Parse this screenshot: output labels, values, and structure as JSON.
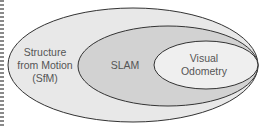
{
  "diagram": {
    "type": "nested-sets",
    "sets": [
      {
        "id": "sfm",
        "lines": [
          "Structure",
          "from Motion",
          "(SfM)"
        ],
        "fill": "#e8e8e8"
      },
      {
        "id": "slam",
        "lines": [
          "SLAM"
        ],
        "fill": "#d0d0d0"
      },
      {
        "id": "vo",
        "lines": [
          "Visual",
          "Odometry"
        ],
        "fill": "#efefef"
      }
    ],
    "stroke": "#333333"
  }
}
